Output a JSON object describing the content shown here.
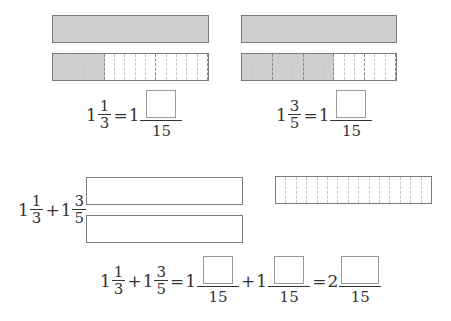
{
  "diagram": {
    "left_model": {
      "whole_bar": "1",
      "fraction_bar": {
        "segments": 15,
        "shaded": 5,
        "major_every": 5
      },
      "equation": {
        "whole": "1",
        "num": "1",
        "den": "3",
        "equals": "=",
        "rhs_whole": "1",
        "rhs_den": "15"
      }
    },
    "right_model": {
      "whole_bar": "1",
      "fraction_bar": {
        "segments": 15,
        "shaded": 9,
        "major_every": 3
      },
      "equation": {
        "whole": "1",
        "num": "3",
        "den": "5",
        "equals": "=",
        "rhs_whole": "1",
        "rhs_den": "15"
      }
    },
    "sum_expression": {
      "a_whole": "1",
      "a_num": "1",
      "a_den": "3",
      "plus": "+",
      "b_whole": "1",
      "b_num": "3",
      "b_den": "5"
    },
    "empty_bars": {
      "count": 2
    },
    "result_bar": {
      "segments": 15,
      "shaded": 0
    },
    "final_equation": {
      "a_whole": "1",
      "a_num": "1",
      "a_den": "3",
      "plus": "+",
      "b_whole": "1",
      "b_num": "3",
      "b_den": "5",
      "equals": "=",
      "c_whole": "1",
      "c_den": "15",
      "plus2": "+",
      "d_whole": "1",
      "d_den": "15",
      "equals2": "=",
      "e_whole": "2",
      "e_den": "15"
    },
    "colors": {
      "shaded": "#cfcfcf",
      "border": "#7a7a7a",
      "dash_minor": "#c8c8c8",
      "dash_major": "#8a8a8a"
    }
  }
}
